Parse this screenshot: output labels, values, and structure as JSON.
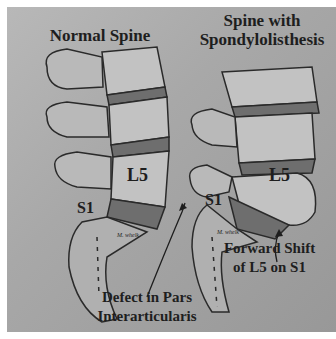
{
  "figure": {
    "left_title": "Normal Spine",
    "right_title_line1": "Spine with",
    "right_title_line2": "Spondylolisthesis",
    "left_labels": {
      "l5": "L5",
      "s1": "S1"
    },
    "right_labels": {
      "l5": "L5",
      "s1": "S1"
    },
    "annotation_defect_line1": "Defect in Pars",
    "annotation_defect_line2": "Interarticularis",
    "annotation_shift_line1": "Forward Shift",
    "annotation_shift_line2": "of L5 on S1",
    "signature": "M. whelk"
  },
  "colors": {
    "background": "#a8a8a8",
    "bone": "#b9b9b9",
    "disc": "#6e6e6e",
    "outline": "#2a2a2a",
    "text": "#1e1e1e"
  }
}
